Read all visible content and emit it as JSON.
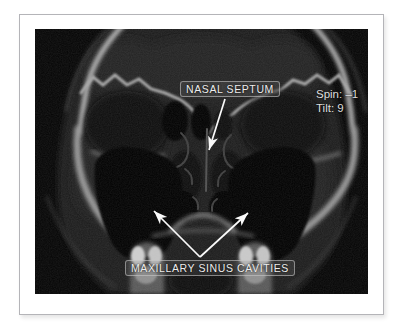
{
  "figure": {
    "background_color": "#ffffff",
    "frame_border_color": "#b4b4b8"
  },
  "scan": {
    "background_color": "#050505",
    "bone_color": "#bdbdbd",
    "annotation_color": "#fafafa",
    "labels": {
      "nasal_septum": "NASAL SEPTUM",
      "maxillary_sinus_cavities": "MAXILLARY SINUS CAVITIES"
    },
    "readout": {
      "spin": "Spin: –1",
      "tilt": "Tilt: 9"
    }
  }
}
